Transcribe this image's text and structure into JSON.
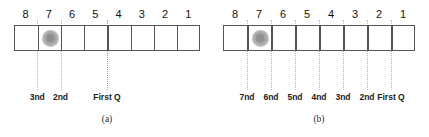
{
  "figure": {
    "panels": [
      {
        "id": "a",
        "caption": "(a)",
        "marker_icon": "coin-marker-icon",
        "marker_cell_index": 1,
        "cell_count": 8,
        "indices": [
          "8",
          "7",
          "6",
          "5",
          "4",
          "3",
          "2",
          "1"
        ],
        "queries": [
          {
            "label": "3nd",
            "boundary_after_cell": 1
          },
          {
            "label": "2nd",
            "boundary_after_cell": 2
          },
          {
            "label": "First Q",
            "boundary_after_cell": 4
          }
        ]
      },
      {
        "id": "b",
        "caption": "(b)",
        "marker_icon": "coin-marker-icon",
        "marker_cell_index": 1,
        "cell_count": 8,
        "indices": [
          "8",
          "7",
          "6",
          "5",
          "4",
          "3",
          "2",
          "1"
        ],
        "queries": [
          {
            "label": "7nd",
            "boundary_after_cell": 1
          },
          {
            "label": "6nd",
            "boundary_after_cell": 2
          },
          {
            "label": "5nd",
            "boundary_after_cell": 3
          },
          {
            "label": "4nd",
            "boundary_after_cell": 4
          },
          {
            "label": "3nd",
            "boundary_after_cell": 5
          },
          {
            "label": "2nd",
            "boundary_after_cell": 6
          },
          {
            "label": "First Q",
            "boundary_after_cell": 7
          }
        ]
      }
    ],
    "colors": {
      "cell_border": "#555555",
      "guide_line": "#b9b9b9",
      "marker_fill": "#a8a8a8",
      "text": "#111111",
      "background": "#ffffff"
    }
  }
}
